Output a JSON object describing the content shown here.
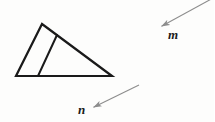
{
  "figure": {
    "type": "geometry-diagram",
    "background_color": "#fdfdfc",
    "stroke_color": "#1a1a1a",
    "arrow_color": "#8d8d8d",
    "labels": {
      "m": "m",
      "n": "n"
    },
    "shapes": {
      "triangle": {
        "name": "triangle",
        "apex": [
          42,
          24
        ],
        "bottom_left": [
          16,
          76
        ],
        "bottom_right": [
          112,
          76
        ],
        "stroke_width": 2.2
      },
      "cevian": {
        "name": "inner-segment",
        "from": [
          57,
          35
        ],
        "to": [
          38,
          76
        ],
        "stroke_width": 2.0
      }
    },
    "arrows": [
      {
        "name": "arrow-m",
        "label": "m",
        "tail": [
          214,
          -2
        ],
        "tip": [
          160,
          27
        ],
        "direction": "down-left",
        "stroke_width": 1.1
      },
      {
        "name": "arrow-n",
        "label": "n",
        "tail": [
          139,
          85
        ],
        "tip": [
          92,
          108
        ],
        "direction": "down-left",
        "stroke_width": 1.1
      }
    ]
  }
}
